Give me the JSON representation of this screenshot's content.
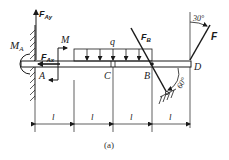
{
  "figure": {
    "caption": "(a)",
    "points": {
      "A": "A",
      "B": "B",
      "C": "C",
      "D": "D"
    },
    "forces": {
      "FAy": {
        "main": "F",
        "sub": "Ay"
      },
      "FAx": {
        "main": "F",
        "sub": "Ax"
      },
      "MA": {
        "main": "M",
        "sub": "A"
      },
      "M": "M",
      "q": "q",
      "FB": {
        "main": "F",
        "sub": "B"
      },
      "F": "F"
    },
    "angles": {
      "F_angle": "30°",
      "support_angle": "60°"
    },
    "dimensions": [
      "l",
      "l",
      "l",
      "l"
    ]
  }
}
